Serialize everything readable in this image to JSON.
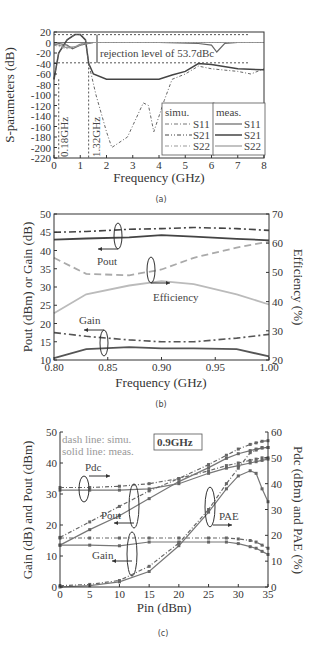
{
  "chart_data": [
    {
      "id": "a",
      "type": "line",
      "caption": "(a)",
      "xlabel": "Frequency (GHz)",
      "ylabel": "S-parameters (dB)",
      "xlim": [
        0,
        8
      ],
      "ylim": [
        -220,
        20
      ],
      "xticks": [
        "0",
        "1",
        "2",
        "3",
        "4",
        "5",
        "6",
        "7",
        "8"
      ],
      "yticks": [
        "20",
        "0",
        "-20",
        "-40",
        "-60",
        "-80",
        "-100",
        "-120",
        "-140",
        "-160",
        "-180",
        "-200",
        "-220"
      ],
      "annotations": [
        "rejection level of 53.7dBc",
        "0.18GHz",
        "1.32GHz"
      ],
      "legend": {
        "simu_title": "simu.",
        "meas_title": "meas.",
        "entries": [
          "S11",
          "S21",
          "S22"
        ]
      },
      "series": [
        {
          "name": "S21 meas.",
          "x": [
            0,
            0.18,
            0.5,
            0.8,
            1.0,
            1.2,
            1.32,
            1.5,
            2,
            3,
            4,
            4.5,
            5,
            5.5,
            6,
            7,
            8
          ],
          "y": [
            -70,
            -20,
            5,
            15,
            15,
            5,
            -40,
            -60,
            -70,
            -70,
            -70,
            -62,
            -55,
            -40,
            -42,
            -50,
            -52
          ]
        },
        {
          "name": "S21 simu.",
          "x": [
            0,
            0.18,
            0.5,
            0.8,
            1.0,
            1.2,
            1.32,
            1.6,
            2.0,
            2.2,
            2.8,
            3.4,
            3.6,
            3.8,
            4.2,
            4.5,
            5,
            5.5,
            6,
            7,
            7.5,
            8
          ],
          "y": [
            -70,
            -20,
            5,
            15,
            15,
            5,
            -40,
            -100,
            -170,
            -200,
            -180,
            -115,
            -120,
            -170,
            -110,
            -70,
            -60,
            -45,
            -50,
            -55,
            -60,
            -50
          ]
        },
        {
          "name": "S11 meas.",
          "x": [
            0,
            0.5,
            0.7,
            1.0,
            1.5,
            2,
            4,
            5.5,
            6,
            6.2,
            6.5,
            7,
            8
          ],
          "y": [
            0,
            -5,
            -12,
            -5,
            0,
            0,
            0,
            -2,
            -5,
            -18,
            -2,
            0,
            0
          ]
        },
        {
          "name": "S22 meas.",
          "x": [
            0,
            0.5,
            0.8,
            1.0,
            1.5,
            8
          ],
          "y": [
            -2,
            -10,
            -8,
            -3,
            0,
            0
          ]
        },
        {
          "name": "S11 simu.",
          "x": [
            0,
            0.5,
            0.8,
            1.0,
            1.5,
            8
          ],
          "y": [
            -3,
            -8,
            -10,
            -3,
            0,
            0
          ]
        },
        {
          "name": "S22 simu.",
          "x": [
            0,
            0.5,
            0.8,
            1.0,
            1.5,
            8
          ],
          "y": [
            -5,
            -12,
            -8,
            -5,
            0,
            0
          ]
        }
      ]
    },
    {
      "id": "b",
      "type": "line",
      "caption": "(b)",
      "xlabel": "Frequency (GHz)",
      "ylabel": "Pout (dBm) or Gain (dB)",
      "y2label": "Efficiency (%)",
      "xlim": [
        0.8,
        1.0
      ],
      "ylim": [
        10,
        50
      ],
      "y2lim": [
        20,
        70
      ],
      "xticks": [
        "0.80",
        "0.85",
        "0.90",
        "0.95",
        "1.00"
      ],
      "yticks": [
        "50",
        "45",
        "40",
        "35",
        "30",
        "25",
        "20",
        "15",
        "10"
      ],
      "y2ticks": [
        "70",
        "60",
        "50",
        "40",
        "30",
        "20"
      ],
      "annotations": [
        "Pout",
        "Efficiency",
        "Gain"
      ],
      "categories": [
        0.8,
        0.83,
        0.87,
        0.9,
        0.93,
        0.97,
        1.0
      ],
      "series": [
        {
          "name": "Pout simu.",
          "axis": "left",
          "values": [
            45.0,
            45.2,
            45.8,
            46.0,
            46.3,
            46.0,
            45.5
          ]
        },
        {
          "name": "Pout meas.",
          "axis": "left",
          "values": [
            43.0,
            43.3,
            43.6,
            44.2,
            43.8,
            43.2,
            42.8
          ]
        },
        {
          "name": "Efficiency simu.",
          "axis": "right",
          "values": [
            55.0,
            49.5,
            49.0,
            51.0,
            55.0,
            58.5,
            60.5
          ]
        },
        {
          "name": "Efficiency meas.",
          "axis": "right",
          "values": [
            36.0,
            42.5,
            45.5,
            47.0,
            46.0,
            42.5,
            39.0
          ]
        },
        {
          "name": "Gain simu.",
          "axis": "left",
          "values": [
            17.5,
            16.5,
            15.5,
            15.0,
            15.0,
            16.0,
            17.0
          ]
        },
        {
          "name": "Gain meas.",
          "axis": "left",
          "values": [
            10.5,
            13.0,
            13.5,
            13.2,
            13.2,
            13.0,
            11.0
          ]
        }
      ]
    },
    {
      "id": "c",
      "type": "line",
      "caption": "(c)",
      "xlabel": "Pin (dBm)",
      "ylabel": "Gain (dB) and Pout (dBm)",
      "y2label": "Pdc (dBm) and PAE (%)",
      "xlim": [
        0,
        35
      ],
      "ylim": [
        0,
        50
      ],
      "y2lim": [
        0,
        60
      ],
      "xticks": [
        "0",
        "5",
        "10",
        "15",
        "20",
        "25",
        "30",
        "35"
      ],
      "yticks": [
        "50",
        "40",
        "30",
        "20",
        "10",
        "0"
      ],
      "y2ticks": [
        "60",
        "50",
        "40",
        "30",
        "20",
        "10",
        "0"
      ],
      "annotations": [
        "dash line: simu.",
        "solid line: meas.",
        "0.9GHz",
        "Pdc",
        "Pout",
        "Gain",
        "PAE"
      ],
      "x": [
        0,
        5,
        10,
        15,
        20,
        25,
        28,
        30,
        32,
        33,
        34,
        35
      ],
      "series": [
        {
          "name": "Pdc simu.",
          "axis": "right",
          "values": [
            38.5,
            38.5,
            39,
            40,
            42,
            45,
            47,
            48,
            49,
            49.5,
            50,
            50
          ]
        },
        {
          "name": "Pdc meas.",
          "axis": "right",
          "values": [
            37.5,
            37.5,
            37.5,
            38,
            40,
            44,
            46,
            47,
            48,
            48.5,
            49,
            49.5
          ]
        },
        {
          "name": "Pout simu.",
          "axis": "left",
          "values": [
            16,
            21,
            26,
            31,
            35,
            39.5,
            42.5,
            44.5,
            46,
            46.5,
            47,
            47.2
          ]
        },
        {
          "name": "Pout meas.",
          "axis": "left",
          "values": [
            13.5,
            18.5,
            23,
            28.5,
            34,
            38.5,
            41.5,
            43,
            44,
            44.5,
            44.8,
            45
          ]
        },
        {
          "name": "Gain simu.",
          "axis": "left",
          "values": [
            15.8,
            15.8,
            15.8,
            15.8,
            15.8,
            15.8,
            15.8,
            15.5,
            15,
            14.5,
            13.5,
            12.5
          ]
        },
        {
          "name": "Gain meas.",
          "axis": "left",
          "values": [
            13.5,
            13.5,
            13.3,
            14.5,
            14.5,
            14.5,
            14.5,
            14,
            13,
            12.5,
            11.5,
            10.5
          ]
        },
        {
          "name": "PAE simu.",
          "axis": "right",
          "values": [
            0.5,
            1,
            2.5,
            8,
            17,
            30,
            40,
            46,
            52,
            53,
            54,
            54
          ]
        },
        {
          "name": "PAE meas.",
          "axis": "right",
          "values": [
            0,
            0.5,
            2,
            6,
            16,
            29,
            38,
            43,
            45,
            44,
            38,
            33
          ]
        }
      ]
    }
  ]
}
